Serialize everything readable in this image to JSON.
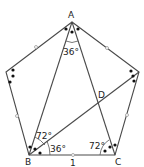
{
  "diagram": {
    "type": "geometry",
    "shape": "regular pentagon with diagonals",
    "vertices": {
      "A": {
        "label": "A",
        "x": 72,
        "y": 22
      },
      "L": {
        "label": "",
        "x": 6,
        "y": 72
      },
      "R": {
        "label": "",
        "x": 139,
        "y": 72
      },
      "B": {
        "label": "B",
        "x": 29,
        "y": 155
      },
      "C": {
        "label": "C",
        "x": 115,
        "y": 155
      },
      "D": {
        "label": "D",
        "x": 99,
        "y": 103
      }
    },
    "labels": {
      "A": "A",
      "B": "B",
      "C": "C",
      "D": "D",
      "side_BC": "1"
    },
    "angles": {
      "at_A": "36°",
      "at_B_upper": "72°",
      "at_B_lower": "36°",
      "at_C": "72°"
    },
    "colors": {
      "line": "#4a4a4a",
      "dots": "#111111",
      "background": "#ffffff"
    }
  }
}
